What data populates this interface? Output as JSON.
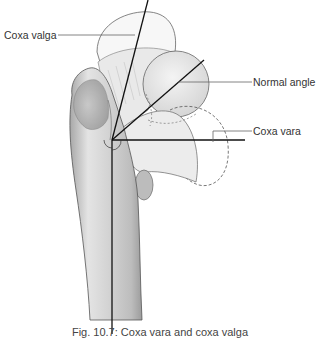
{
  "figure": {
    "title": "Coxa vara and coxa valga",
    "caption": "Fig. 10.7: Coxa vara and coxa valga",
    "labels": {
      "coxa_valga": "Coxa valga",
      "normal_angle": "Normal angle",
      "coxa_vara": "Coxa vara"
    },
    "colors": {
      "bone_light": "#e6e6e6",
      "bone_mid": "#c8c8c8",
      "bone_dark": "#9a9a9a",
      "outline": "#555555",
      "axis_line": "#111111",
      "leader_line": "#666666"
    }
  }
}
